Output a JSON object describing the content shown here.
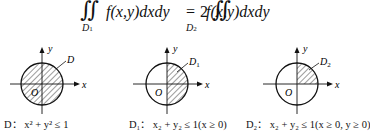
{
  "formula": {
    "lhs_integral": "∬",
    "lhs_region": "D",
    "lhs_region_sub": "1",
    "lhs_integrand": "f(x,y)dxdy",
    "equals": "=",
    "coefficient": "2",
    "rhs_integral": "∬",
    "rhs_region": "D",
    "rhs_region_sub": "2",
    "rhs_integrand": "f(x,y)dxdy"
  },
  "diagrams": [
    {
      "region_label": "D",
      "axis_x": "x",
      "axis_y": "y",
      "origin": "O",
      "shaded": "full disk",
      "caption": "D： x² + y² ≤ 1"
    },
    {
      "region_label": "D₁",
      "axis_x": "x",
      "axis_y": "y",
      "origin": "O",
      "shaded": "right half disk",
      "caption": "D₁： x₂ + y₂ ≤ 1(x ≥ 0)"
    },
    {
      "region_label": "D₂",
      "axis_x": "x",
      "axis_y": "y",
      "origin": "O",
      "shaded": "first quadrant",
      "caption": "D₂： x₂ + y₂ ≤ 1(x ≥ 0, y ≥ 0)"
    }
  ]
}
